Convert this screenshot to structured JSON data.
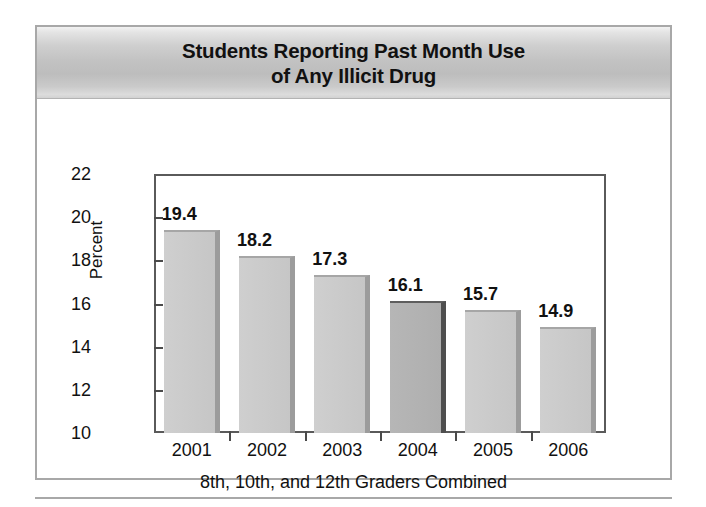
{
  "figure": {
    "title_line_1": "Students Reporting Past Month Use",
    "title_line_2": "of Any Illicit Drug",
    "caption": "8th, 10th, and 12th Graders Combined"
  },
  "colors": {
    "bar_light": "#cacaca",
    "bar_light_edge": "#9c9c9c",
    "bar_dark": "#b2b2b2",
    "bar_dark_edge": "#4e4e4e",
    "axis": "#4a4a4a",
    "frame": "#a8a8a8",
    "banner_mid": "#c2c2c2",
    "text": "#111111"
  },
  "chart_data": {
    "type": "bar",
    "title": "Students Reporting Past Month Use of Any Illicit Drug",
    "subtitle": "",
    "xlabel": "8th, 10th, and 12th Graders Combined",
    "ylabel": "Percent",
    "categories": [
      "2001",
      "2002",
      "2003",
      "2004",
      "2005",
      "2006"
    ],
    "values": [
      19.4,
      18.2,
      17.3,
      16.1,
      15.7,
      14.9
    ],
    "data_labels": [
      "19.4",
      "18.2",
      "17.3",
      "16.1",
      "15.7",
      "14.9"
    ],
    "highlighted_category": "2004",
    "ylim": [
      10,
      22
    ],
    "yticks": [
      10,
      12,
      14,
      16,
      18,
      20,
      22
    ],
    "ytick_labels": [
      "10",
      "12",
      "14",
      "16",
      "18",
      "20",
      "22"
    ],
    "grid": false,
    "legend": false,
    "legend_position": "none"
  }
}
